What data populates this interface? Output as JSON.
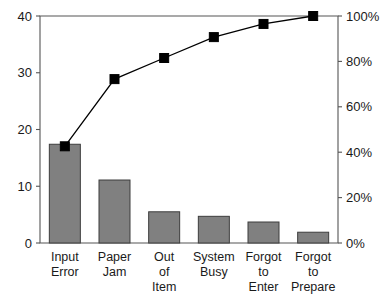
{
  "chart_data": {
    "type": "bar",
    "title": "",
    "subtitle": "",
    "xlabel": "",
    "ylabel": "",
    "y2label": "",
    "categories": [
      "Input\nError",
      "Paper\nJam",
      "Out\nof\nItem",
      "System\nBusy",
      "Forgot\nto\nEnter",
      "Forgot\nto\nPrepare"
    ],
    "category_lines": [
      [
        "Input",
        "Error"
      ],
      [
        "Paper",
        "Jam"
      ],
      [
        "Out",
        "of",
        "Item"
      ],
      [
        "System",
        "Busy"
      ],
      [
        "Forgot",
        "to",
        "Enter"
      ],
      [
        "Forgot",
        "to",
        "Prepare"
      ]
    ],
    "series": [
      {
        "name": "Count",
        "type": "bar",
        "axis": "left",
        "values": [
          17.4,
          11.1,
          5.5,
          4.7,
          3.7,
          1.9
        ],
        "color": "#808080"
      },
      {
        "name": "Cumulative Percentage",
        "type": "line",
        "axis": "right",
        "values": [
          42.6,
          72.2,
          81.5,
          90.7,
          96.5,
          100.0
        ],
        "color": "#000000",
        "marker": "square"
      }
    ],
    "ylim": [
      0,
      40
    ],
    "y2lim": [
      0,
      100
    ],
    "yticks": [
      0,
      10,
      20,
      30,
      40
    ],
    "ytick_labels": [
      "0",
      "10",
      "20",
      "30",
      "40"
    ],
    "y2ticks": [
      0,
      20,
      40,
      60,
      80,
      100
    ],
    "y2tick_labels": [
      "0%",
      "20%",
      "40%",
      "60%",
      "80%",
      "100%"
    ],
    "grid": false,
    "legend": false,
    "legend_position": "none",
    "background_color": "#ffffff",
    "axis_color": "#555555",
    "bar_fill_color": "#808080",
    "bar_edge_color": "#3d3d3d",
    "line_color": "#000000"
  }
}
